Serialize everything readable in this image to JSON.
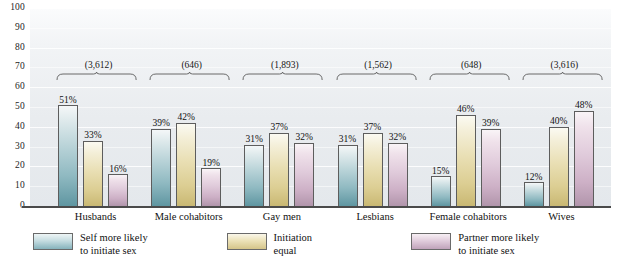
{
  "chart_data": {
    "type": "bar",
    "title": "",
    "subtitle": "",
    "xlabel": "",
    "ylabel": "",
    "ylim": [
      0,
      100
    ],
    "yticks": [
      100,
      90,
      80,
      70,
      60,
      50,
      40,
      30,
      20,
      10,
      0
    ],
    "ytick_labels": [
      "100",
      "90",
      "80",
      "70",
      "60",
      "50",
      "40",
      "30",
      "20",
      "10",
      "0"
    ],
    "grid": true,
    "legend_position": "bottom",
    "categories": [
      "Husbands",
      "Male cohabitors",
      "Gay men",
      "Lesbians",
      "Female cohabitors",
      "Wives"
    ],
    "group_annotations": [
      "(3,612)",
      "(646)",
      "(1,893)",
      "(1,562)",
      "(648)",
      "(3,616)"
    ],
    "series": [
      {
        "name": "Self more likely to initiate sex",
        "color": "#8fb9c1",
        "values": [
          51,
          39,
          31,
          31,
          15,
          12
        ],
        "value_labels": [
          "51%",
          "39%",
          "31%",
          "31%",
          "15%",
          "12%"
        ]
      },
      {
        "name": "Initiation equal",
        "color": "#dcce93",
        "values": [
          33,
          42,
          37,
          37,
          46,
          40
        ],
        "value_labels": [
          "33%",
          "42%",
          "37%",
          "37%",
          "46%",
          "40%"
        ]
      },
      {
        "name": "Partner more likely to initiate sex",
        "color": "#cdb0c6",
        "values": [
          16,
          19,
          32,
          32,
          39,
          48
        ],
        "value_labels": [
          "16%",
          "19%",
          "32%",
          "32%",
          "39%",
          "48%"
        ]
      }
    ]
  },
  "legend": {
    "items": [
      {
        "line1": "Self more likely",
        "line2": "to initiate sex",
        "swatch": "teal-swatch"
      },
      {
        "line1": "Initiation",
        "line2": "equal",
        "swatch": "gold-swatch"
      },
      {
        "line1": "Partner more likely",
        "line2": "to initiate sex",
        "swatch": "mauve-swatch"
      }
    ]
  }
}
